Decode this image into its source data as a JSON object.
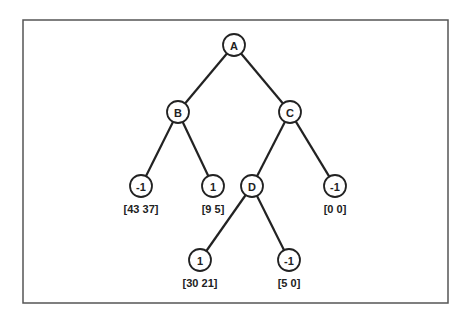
{
  "diagram": {
    "type": "tree",
    "frame": {
      "x": 23,
      "y": 20,
      "width": 425,
      "height": 283
    },
    "colors": {
      "line": "#222222",
      "frame": "#555555",
      "background": "#ffffff"
    },
    "nodes": [
      {
        "id": "A",
        "label": "A",
        "x": 234,
        "y": 45,
        "counts": null
      },
      {
        "id": "B",
        "label": "B",
        "x": 178,
        "y": 112,
        "counts": null
      },
      {
        "id": "C",
        "label": "C",
        "x": 290,
        "y": 112,
        "counts": null
      },
      {
        "id": "L1",
        "label": "-1",
        "x": 141,
        "y": 186,
        "counts": "[43 37]"
      },
      {
        "id": "L2",
        "label": "1",
        "x": 213,
        "y": 186,
        "counts": "[9 5]"
      },
      {
        "id": "D",
        "label": "D",
        "x": 252,
        "y": 186,
        "counts": null
      },
      {
        "id": "L3",
        "label": "-1",
        "x": 335,
        "y": 186,
        "counts": "[0 0]"
      },
      {
        "id": "L4",
        "label": "1",
        "x": 200,
        "y": 260,
        "counts": "[30 21]"
      },
      {
        "id": "L5",
        "label": "-1",
        "x": 289,
        "y": 260,
        "counts": "[5 0]"
      }
    ],
    "edges": [
      {
        "from": "A",
        "to": "B"
      },
      {
        "from": "A",
        "to": "C"
      },
      {
        "from": "B",
        "to": "L1"
      },
      {
        "from": "B",
        "to": "L2"
      },
      {
        "from": "C",
        "to": "D"
      },
      {
        "from": "C",
        "to": "L3"
      },
      {
        "from": "D",
        "to": "L4"
      },
      {
        "from": "D",
        "to": "L5"
      }
    ]
  }
}
